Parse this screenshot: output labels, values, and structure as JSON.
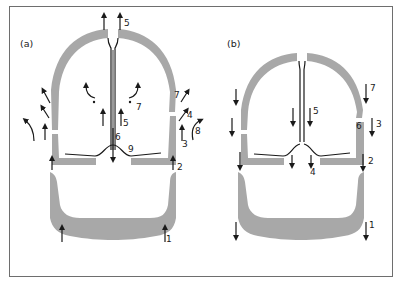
{
  "figure": {
    "panels": [
      {
        "id": "a",
        "label": "(a)",
        "arrow_direction": "up",
        "numbers": {
          "n1": "1",
          "n2": "2",
          "n3": "3",
          "n4": "4",
          "n5_top": "5",
          "n5_inner": "5",
          "n6": "6",
          "n7_inner": "7",
          "n7_outer": "7",
          "n8": "8",
          "n9": "9"
        }
      },
      {
        "id": "b",
        "label": "(b)",
        "arrow_direction": "down",
        "numbers": {
          "n1": "1",
          "n2": "2",
          "n3": "3",
          "n4": "4",
          "n5": "5",
          "n6": "6",
          "n7": "7"
        }
      }
    ],
    "colors": {
      "shell": "#a8a8a8",
      "line": "#1a1a1a",
      "frame": "#6e6e6e",
      "background": "#ffffff"
    }
  }
}
